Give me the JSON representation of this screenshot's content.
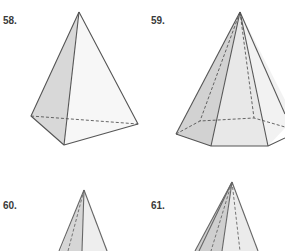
{
  "figures": [
    {
      "number": "58.",
      "shape": "triangular-pyramid"
    },
    {
      "number": "59.",
      "shape": "hexagonal-pyramid"
    },
    {
      "number": "60.",
      "shape": "pyramid-partial"
    },
    {
      "number": "61.",
      "shape": "pyramid-partial"
    }
  ],
  "colors": {
    "edge": "#555555",
    "shade_dark": "#d6d6d6",
    "shade_light": "#ececec",
    "label": "#3a3a3a"
  }
}
